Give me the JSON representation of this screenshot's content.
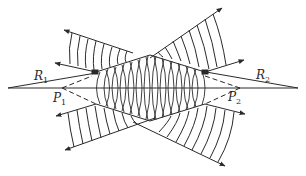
{
  "diagram": {
    "title": "",
    "type": "wave-interference-ray-diagram",
    "colors": {
      "ink": "#2a2a2a",
      "background": "#ffffff"
    },
    "labels": {
      "R1": {
        "base": "R",
        "sub": "1"
      },
      "R2": {
        "base": "R",
        "sub": "2"
      },
      "P1": {
        "base": "P",
        "sub": "1"
      },
      "P2": {
        "base": "P",
        "sub": "2"
      }
    },
    "elements": [
      "central horizontal axis line",
      "ray R1 from left converging toward center",
      "ray R2 from right converging toward center",
      "dashed line from P1",
      "dashed line from P2",
      "upper-left wavefront fan with arrows",
      "upper-right wavefront fan with arrows",
      "lower-left wavefront fan with arrows",
      "lower-right wavefront fan with arrows",
      "central lens-shaped overlap region of wavefronts"
    ]
  }
}
